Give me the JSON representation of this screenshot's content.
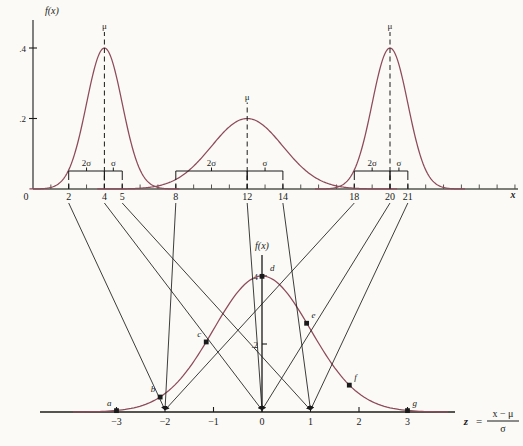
{
  "figure": {
    "title_axis_label_top": "f(x)",
    "title_axis_label_bottom": "f(x)",
    "x_axis_label": "x",
    "z_axis_label": "z",
    "z_equals": "=",
    "z_formula_numerator": "x − μ",
    "z_formula_denominator": "σ",
    "curve_color": "#8d4a5a",
    "axis_color": "#55544f",
    "ink_color": "#1a1a1a",
    "background_color": "#fbfaf6"
  },
  "top_plot": {
    "y_axis_label": "f(x)",
    "y_ticks": [
      {
        "label": ".2",
        "value": 0.2
      },
      {
        "label": ".4",
        "value": 0.4
      }
    ],
    "x_origin_label": "0",
    "x_axis_label": "x",
    "x_tick_labels": [
      "2",
      "4",
      "5",
      "8",
      "12",
      "14",
      "18",
      "20",
      "21"
    ],
    "x_tick_values": [
      2,
      4,
      5,
      8,
      12,
      14,
      18,
      20,
      21
    ],
    "mu_label": "μ",
    "sigma_label": "σ",
    "two_sigma_label": "2σ",
    "curves": [
      {
        "name": "left-normal",
        "mu": 4,
        "sigma": 1,
        "peak_label": "μ",
        "peak_height": 0.4
      },
      {
        "name": "middle-normal",
        "mu": 12,
        "sigma": 2,
        "peak_label": "μ",
        "peak_height": 0.2
      },
      {
        "name": "right-normal",
        "mu": 20,
        "sigma": 1,
        "peak_label": "μ",
        "peak_height": 0.4
      }
    ],
    "brackets": [
      {
        "name": "left-two-sigma",
        "label": "2σ",
        "from": 2,
        "to": 4
      },
      {
        "name": "left-one-sigma",
        "label": "σ",
        "from": 4,
        "to": 5
      },
      {
        "name": "middle-two-sigma",
        "label": "2σ",
        "from": 8,
        "to": 12
      },
      {
        "name": "middle-one-sigma",
        "label": "σ",
        "from": 12,
        "to": 14
      },
      {
        "name": "right-two-sigma",
        "label": "2σ",
        "from": 18,
        "to": 20
      },
      {
        "name": "right-one-sigma",
        "label": "σ",
        "from": 20,
        "to": 21
      }
    ]
  },
  "bottom_plot": {
    "y_axis_label": "f(x)",
    "y_ticks": [
      {
        "label": ".2",
        "value": 0.2
      },
      {
        "label": ".4",
        "value": 0.4
      }
    ],
    "z_tick_labels": [
      "−3",
      "−2",
      "−1",
      "0",
      "1",
      "2",
      "3"
    ],
    "z_tick_values": [
      -3,
      -2,
      -1,
      0,
      1,
      2,
      3
    ],
    "curve": {
      "name": "standard-normal",
      "mu": 0,
      "sigma": 1,
      "peak_height": 0.4
    },
    "points": [
      {
        "label": "a",
        "z": -3.0,
        "fz": 0.004
      },
      {
        "label": "b",
        "z": -2.1,
        "fz": 0.044
      },
      {
        "label": "c",
        "z": -1.15,
        "fz": 0.206
      },
      {
        "label": "d",
        "z": 0.0,
        "fz": 0.399
      },
      {
        "label": "e",
        "z": 0.92,
        "fz": 0.261
      },
      {
        "label": "f",
        "z": 1.8,
        "fz": 0.079
      },
      {
        "label": "g",
        "z": 3.0,
        "fz": 0.004
      }
    ]
  },
  "mapping_lines": [
    {
      "name": "map-2-to-minus2",
      "from_x": 2,
      "to_z": -2
    },
    {
      "name": "map-4-to-0",
      "from_x": 4,
      "to_z": 0
    },
    {
      "name": "map-5-to-1",
      "from_x": 5,
      "to_z": 1
    },
    {
      "name": "map-8-to-minus2",
      "from_x": 8,
      "to_z": -2
    },
    {
      "name": "map-12-to-0",
      "from_x": 12,
      "to_z": 0
    },
    {
      "name": "map-14-to-1",
      "from_x": 14,
      "to_z": 1
    },
    {
      "name": "map-18-to-minus2",
      "from_x": 18,
      "to_z": -2
    },
    {
      "name": "map-20-to-0",
      "from_x": 20,
      "to_z": 0
    },
    {
      "name": "map-21-to-1",
      "from_x": 21,
      "to_z": 1
    }
  ]
}
